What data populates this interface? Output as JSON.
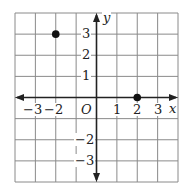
{
  "chart_data": {
    "type": "scatter",
    "title": "",
    "xlabel": "x",
    "ylabel": "y",
    "origin_label": "O",
    "xlim": [
      -4,
      4
    ],
    "ylim": [
      -4,
      4
    ],
    "grid": true,
    "x_tick_labels": [
      "−3",
      "−2",
      "1",
      "2",
      "3"
    ],
    "y_tick_labels": [
      "3",
      "2",
      "1",
      "−2",
      "−3"
    ],
    "points": [
      {
        "x": -2,
        "y": 3
      },
      {
        "x": 2,
        "y": 0
      }
    ]
  },
  "colors": {
    "grid": "#8a8a8a",
    "axis": "#222222",
    "point": "#111111"
  }
}
